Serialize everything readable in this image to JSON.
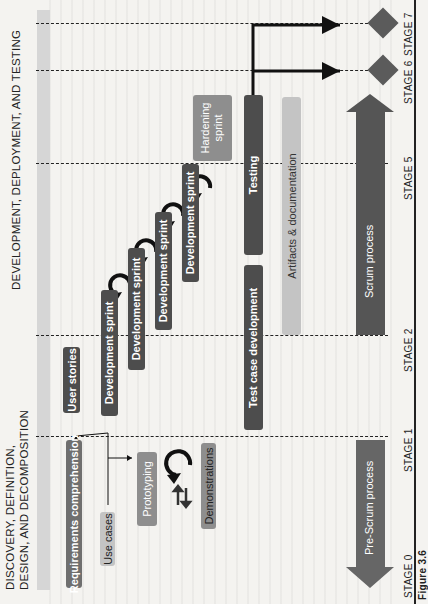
{
  "sections": {
    "left_title_line1": "DISCOVERY, DEFINITION,",
    "left_title_line2": "DESIGN, AND DECOMPOSITION",
    "right_title": "DEVELOPMENT, DEPLOYMENT, AND TESTING"
  },
  "stages": [
    {
      "label": "STAGE 0"
    },
    {
      "label": "STAGE 1"
    },
    {
      "label": "STAGE 2"
    },
    {
      "label": "STAGE 5"
    },
    {
      "label": "STAGE 6"
    },
    {
      "label": "STAGE 7"
    }
  ],
  "boxes": {
    "requirements": "Requirements comprehension",
    "use_cases": "Use cases",
    "prototyping": "Prototyping",
    "demonstrations": "Demonstrations",
    "user_stories": "User stories",
    "dev_sprint_1": "Development sprint",
    "dev_sprint_2": "Development sprint",
    "dev_sprint_3": "Development sprint",
    "dev_sprint_4": "Development sprint",
    "hardening_line1": "Hardening",
    "hardening_line2": "sprint",
    "test_case": "Test case development",
    "testing": "Testing",
    "artifacts": "Artifacts & documentation"
  },
  "arrows": {
    "pre_scrum": "Pre-Scrum process",
    "scrum": "Scrum process"
  },
  "caption": {
    "figure_label": "Figure 3.6"
  },
  "colors": {
    "dark_box": "#4d4d4d",
    "mid_box": "#6f6f6f",
    "light_box": "#8e8e8e",
    "pale_box": "#c4c4c4",
    "milestone": "#5b5b5b"
  }
}
